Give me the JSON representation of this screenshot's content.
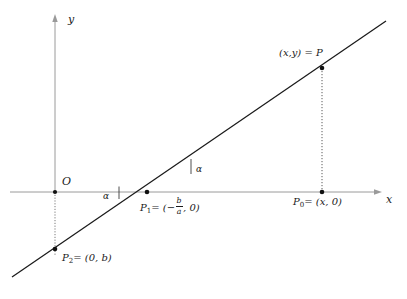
{
  "figure": {
    "kind": "line-graph-geometry-diagram",
    "background_color": "#ffffff",
    "stroke_color": "#1a1a1a",
    "axis_color": "#8a8a8a"
  },
  "axes": {
    "x_label": "x",
    "y_label": "y",
    "origin_label": "O",
    "x_axis_from": [
      10,
      192
    ],
    "x_axis_to": [
      382,
      192
    ],
    "y_axis_from": [
      55,
      192
    ],
    "y_axis_to": [
      55,
      14
    ],
    "y_axis_dotted_from": [
      55,
      192
    ],
    "y_axis_dotted_to": [
      55,
      255
    ]
  },
  "line": {
    "description": "straight line y = a x + b",
    "from": [
      12,
      277
    ],
    "to": [
      386,
      21
    ]
  },
  "points": [
    {
      "id": "P",
      "label": "(x,y) = P",
      "label_x": 279,
      "label_y": 50,
      "dot_x": 322,
      "dot_y": 68
    },
    {
      "id": "P0",
      "label_prefix": "P",
      "label_sub": "0",
      "label_rest": "= (x, 0)",
      "label_x": 293,
      "label_y": 196,
      "dot_x": 322,
      "dot_y": 192
    },
    {
      "id": "P1",
      "label_prefix": "P",
      "label_sub": "1",
      "label_eq": "= (−",
      "frac_num": "b",
      "frac_den": "a",
      "label_tail": ", 0)",
      "label_x": 140,
      "label_y": 196,
      "dot_x": 147,
      "dot_y": 192
    },
    {
      "id": "P2",
      "label_prefix": "P",
      "label_sub": "2",
      "label_rest": "= (0, b)",
      "label_x": 62,
      "label_y": 252,
      "dot_x": 55,
      "dot_y": 249
    }
  ],
  "angles": [
    {
      "id": "alpha-left",
      "label": "α",
      "label_x": 103,
      "label_y": 197,
      "tick_x": 119,
      "tick_top": 187,
      "tick_bottom": 199
    },
    {
      "id": "alpha-right",
      "label": "α",
      "label_x": 196,
      "label_y": 170,
      "tick_x": 191,
      "tick_top": 160,
      "tick_bottom": 174
    }
  ],
  "dotted_drop": {
    "from": [
      322,
      68
    ],
    "to": [
      322,
      192
    ]
  }
}
